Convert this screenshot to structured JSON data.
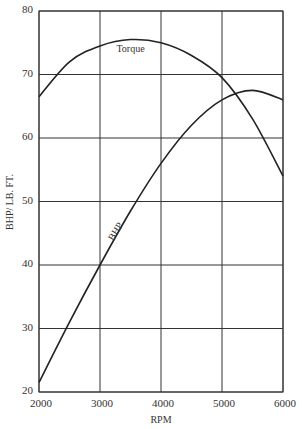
{
  "chart_data": {
    "type": "line",
    "title": "",
    "xlabel": "RPM",
    "ylabel": "BHP/ LB. FT.",
    "x_ticks": [
      "2000",
      "3000",
      "4000",
      "5000",
      "6000"
    ],
    "y_ticks": [
      "20",
      "30",
      "40",
      "50",
      "60",
      "70",
      "80"
    ],
    "xlim": [
      2000,
      6000
    ],
    "ylim": [
      20,
      80
    ],
    "grid": true,
    "legend": "none (inline curve labels)",
    "x": [
      2000,
      2500,
      3000,
      3500,
      4000,
      4500,
      5000,
      5500,
      6000
    ],
    "series": [
      {
        "name": "Torque",
        "values": [
          66.5,
          72,
          74.5,
          75.5,
          75,
          73,
          69.5,
          63,
          54
        ]
      },
      {
        "name": "BHP",
        "values": [
          21.5,
          31,
          40,
          48.5,
          56,
          62,
          66,
          67.5,
          66
        ]
      }
    ],
    "annotations": [
      {
        "text": "Torque",
        "at": [
          3500,
          73.5
        ]
      },
      {
        "text": "BHP",
        "at": [
          3300,
          45
        ],
        "rotated": true
      }
    ]
  }
}
